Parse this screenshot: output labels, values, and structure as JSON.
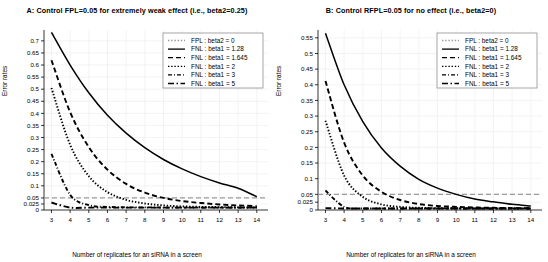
{
  "chart_data": [
    {
      "type": "line",
      "panel": "A",
      "title": "A: Control FPL=0.05 for extremely weak effect (i.e., beta2=0.25)",
      "xlabel": "Number of replicates for an siRNA in a screen",
      "ylabel": "Error rates",
      "xlim": [
        2.6,
        14.6
      ],
      "ylim": [
        0,
        0.745
      ],
      "xticks": [
        3,
        4,
        5,
        6,
        7,
        8,
        9,
        10,
        11,
        12,
        13,
        14
      ],
      "yticks": [
        0,
        0.025,
        0.05,
        0.1,
        0.15,
        0.2,
        0.25,
        0.3,
        0.35,
        0.4,
        0.45,
        0.5,
        0.55,
        0.6,
        0.65,
        0.7
      ],
      "ytick_labels": [
        "0",
        "0.025",
        "0.05",
        "0.1",
        "0.15",
        "0.2",
        "0.25",
        "0.3",
        "0.35",
        "0.4",
        "0.45",
        "0.5",
        "0.55",
        "0.6",
        "0.65",
        "0.7"
      ],
      "grid": true,
      "legend_position": "top-right",
      "x": [
        3,
        4,
        5,
        6,
        7,
        8,
        9,
        10,
        11,
        12,
        13,
        14
      ],
      "series": [
        {
          "name": "FPL : beta2 = 0",
          "style": "dotted",
          "color": "#9a9a9a",
          "constant": 0.05,
          "values": [
            0.05,
            0.05,
            0.05,
            0.05,
            0.05,
            0.05,
            0.05,
            0.05,
            0.05,
            0.05,
            0.05,
            0.05
          ]
        },
        {
          "name": "FNL : beta1 = 1.28",
          "style": "solid",
          "color": "#000000",
          "values": [
            0.735,
            0.6,
            0.485,
            0.392,
            0.318,
            0.258,
            0.209,
            0.17,
            0.138,
            0.112,
            0.09,
            0.055
          ]
        },
        {
          "name": "FNL : beta1 = 1.645",
          "style": "dashed",
          "color": "#000000",
          "values": [
            0.62,
            0.405,
            0.26,
            0.167,
            0.108,
            0.072,
            0.05,
            0.037,
            0.029,
            0.023,
            0.019,
            0.016
          ]
        },
        {
          "name": "FNL : beta1 = 2",
          "style": "dotted",
          "color": "#000000",
          "values": [
            0.505,
            0.27,
            0.14,
            0.074,
            0.042,
            0.027,
            0.019,
            0.015,
            0.013,
            0.012,
            0.011,
            0.011
          ]
        },
        {
          "name": "FNL : beta1 = 3",
          "style": "dashdot-short",
          "color": "#000000",
          "values": [
            0.232,
            0.063,
            0.02,
            0.013,
            0.011,
            0.011,
            0.01,
            0.01,
            0.01,
            0.01,
            0.01,
            0.01
          ]
        },
        {
          "name": "FNL : beta1 = 5",
          "style": "dashdot",
          "color": "#000000",
          "values": [
            0.031,
            0.01,
            0.01,
            0.01,
            0.01,
            0.01,
            0.01,
            0.01,
            0.01,
            0.01,
            0.01,
            0.01
          ]
        }
      ]
    },
    {
      "type": "line",
      "panel": "B",
      "title": "B: Control RFPL=0.05 for no effect (i.e., beta2=0)",
      "xlabel": "Number of replicates for an siRNA in a screen",
      "ylabel": "Error rates",
      "xlim": [
        2.6,
        14.6
      ],
      "ylim": [
        0,
        0.575
      ],
      "xticks": [
        3,
        4,
        5,
        6,
        7,
        8,
        9,
        10,
        11,
        12,
        13,
        14
      ],
      "yticks": [
        0,
        0.025,
        0.05,
        0.1,
        0.15,
        0.2,
        0.25,
        0.3,
        0.35,
        0.4,
        0.45,
        0.5,
        0.55
      ],
      "ytick_labels": [
        "0",
        "0.025",
        "0.05",
        "0.1",
        "0.15",
        "0.2",
        "0.25",
        "0.3",
        "0.35",
        "0.4",
        "0.45",
        "0.5",
        "0.55"
      ],
      "grid": true,
      "legend_position": "top-right",
      "x": [
        3,
        4,
        5,
        6,
        7,
        8,
        9,
        10,
        11,
        12,
        13,
        14
      ],
      "series": [
        {
          "name": "FPL : beta2 = 0",
          "style": "dotted",
          "color": "#9a9a9a",
          "constant": 0.05,
          "values": [
            0.05,
            0.05,
            0.05,
            0.05,
            0.05,
            0.05,
            0.05,
            0.05,
            0.05,
            0.05,
            0.05,
            0.05
          ]
        },
        {
          "name": "FNL : beta1 = 1.28",
          "style": "solid",
          "color": "#000000",
          "values": [
            0.565,
            0.4,
            0.282,
            0.198,
            0.14,
            0.098,
            0.07,
            0.05,
            0.035,
            0.026,
            0.018,
            0.013
          ]
        },
        {
          "name": "FNL : beta1 = 1.645",
          "style": "dashed",
          "color": "#000000",
          "values": [
            0.412,
            0.215,
            0.11,
            0.058,
            0.032,
            0.019,
            0.013,
            0.01,
            0.008,
            0.007,
            0.006,
            0.006
          ]
        },
        {
          "name": "FNL : beta1 = 2",
          "style": "dotted",
          "color": "#000000",
          "values": [
            0.285,
            0.11,
            0.042,
            0.018,
            0.01,
            0.007,
            0.006,
            0.006,
            0.005,
            0.005,
            0.005,
            0.005
          ]
        },
        {
          "name": "FNL : beta1 = 3",
          "style": "dashdot-short",
          "color": "#000000",
          "values": [
            0.062,
            0.01,
            0.005,
            0.005,
            0.005,
            0.005,
            0.005,
            0.005,
            0.005,
            0.005,
            0.005,
            0.005
          ]
        },
        {
          "name": "FNL : beta1 = 5",
          "style": "dashdot",
          "color": "#000000",
          "values": [
            0.006,
            0.005,
            0.005,
            0.005,
            0.005,
            0.005,
            0.005,
            0.005,
            0.005,
            0.005,
            0.005,
            0.005
          ]
        }
      ]
    }
  ],
  "style": {
    "grid_color": "#f0f0f0",
    "axis_color": "#000000",
    "fpl_line_color": "#a8a8a8",
    "background": "#ffffff"
  }
}
